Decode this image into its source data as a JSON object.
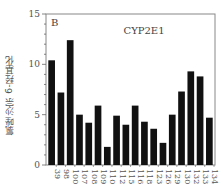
{
  "chart_data": {
    "type": "bar",
    "panel_label": "B",
    "title": "CYP2E1",
    "xlabel": "",
    "ylabel": "氯唑沙宗 6-羟基化",
    "ylim": [
      0,
      15
    ],
    "yticks": [
      0,
      5,
      10,
      15
    ],
    "grid": false,
    "legend": null,
    "bar_color": "#111111",
    "categories": [
      "39",
      "98",
      "100",
      "107",
      "108",
      "109",
      "110",
      "112",
      "115",
      "116",
      "118",
      "123",
      "126",
      "129",
      "130",
      "132",
      "133",
      "134"
    ],
    "values": [
      10.4,
      7.2,
      12.4,
      5.0,
      4.2,
      5.9,
      1.8,
      4.9,
      4.0,
      5.9,
      4.3,
      3.6,
      2.2,
      5.0,
      7.3,
      9.3,
      8.8,
      4.7
    ]
  }
}
